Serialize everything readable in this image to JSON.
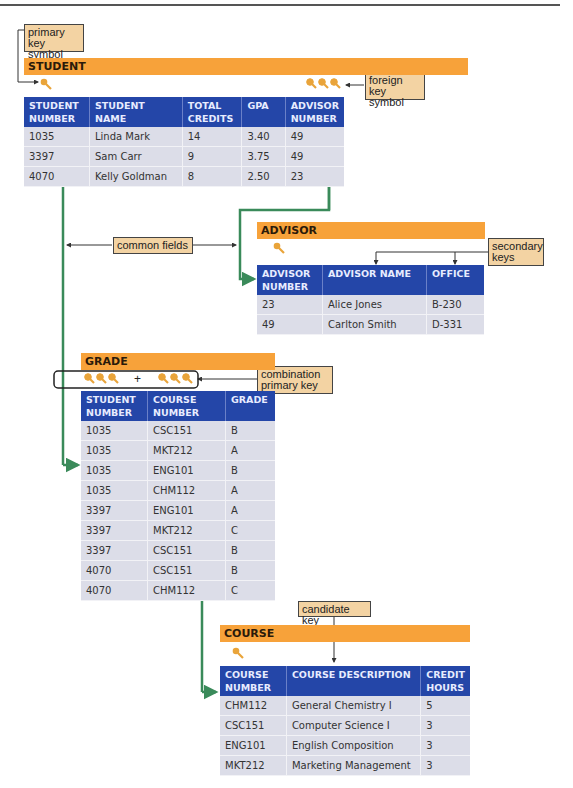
{
  "callouts": {
    "primary_key": "primary key symbol",
    "foreign_key": "foreign key symbol",
    "common_fields": "common fields",
    "secondary_keys": "secondary keys",
    "combination_primary_key": "combination primary key",
    "candidate_key": "candidate key"
  },
  "icons": {
    "key": "key-icon",
    "plus": "+"
  },
  "colors": {
    "title_bar": "#f7a23a",
    "header": "#2446a8",
    "row": "#dcdde8",
    "link_line": "#3a8a5a",
    "callout": "#f3d3a3"
  },
  "tables": {
    "student": {
      "title": "STUDENT",
      "headers": [
        "STUDENT NUMBER",
        "STUDENT NAME",
        "TOTAL CREDITS",
        "GPA",
        "ADVISOR NUMBER"
      ],
      "rows": [
        [
          "1035",
          "Linda Mark",
          "14",
          "3.40",
          "49"
        ],
        [
          "3397",
          "Sam Carr",
          "9",
          "3.75",
          "49"
        ],
        [
          "4070",
          "Kelly Goldman",
          "8",
          "2.50",
          "23"
        ]
      ]
    },
    "advisor": {
      "title": "ADVISOR",
      "headers": [
        "ADVISOR NUMBER",
        "ADVISOR NAME",
        "OFFICE"
      ],
      "rows": [
        [
          "23",
          "Alice Jones",
          "B-230"
        ],
        [
          "49",
          "Carlton Smith",
          "D-331"
        ]
      ]
    },
    "grade": {
      "title": "GRADE",
      "headers": [
        "STUDENT NUMBER",
        "COURSE NUMBER",
        "GRADE"
      ],
      "rows": [
        [
          "1035",
          "CSC151",
          "B"
        ],
        [
          "1035",
          "MKT212",
          "A"
        ],
        [
          "1035",
          "ENG101",
          "B"
        ],
        [
          "1035",
          "CHM112",
          "A"
        ],
        [
          "3397",
          "ENG101",
          "A"
        ],
        [
          "3397",
          "MKT212",
          "C"
        ],
        [
          "3397",
          "CSC151",
          "B"
        ],
        [
          "4070",
          "CSC151",
          "B"
        ],
        [
          "4070",
          "CHM112",
          "C"
        ]
      ]
    },
    "course": {
      "title": "COURSE",
      "headers": [
        "COURSE NUMBER",
        "COURSE DESCRIPTION",
        "CREDIT HOURS"
      ],
      "rows": [
        [
          "CHM112",
          "General Chemistry I",
          "5"
        ],
        [
          "CSC151",
          "Computer Science I",
          "3"
        ],
        [
          "ENG101",
          "English Composition",
          "3"
        ],
        [
          "MKT212",
          "Marketing Management",
          "3"
        ]
      ]
    }
  }
}
